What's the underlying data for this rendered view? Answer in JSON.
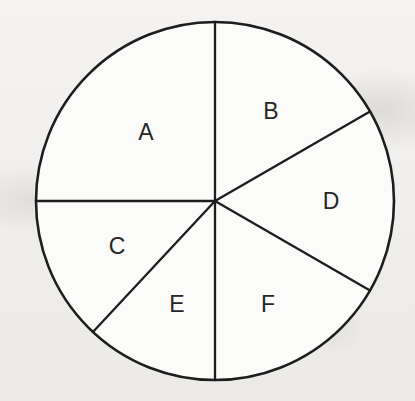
{
  "figure": {
    "background_color": "#f2f1ef",
    "sector_fill_color": "#fbfbfa",
    "line_color": "#1d1d1d"
  },
  "chart_data": {
    "type": "pie",
    "title": "",
    "subtitle": "",
    "xlabel": "",
    "ylabel": "",
    "legend": "none",
    "grid": false,
    "labels_shown_on_slices": true,
    "center": {
      "x": 215,
      "y": 201
    },
    "radius": 179,
    "angle_units": "degrees clockwise from 12 o'clock",
    "categories": [
      "A",
      "B",
      "C",
      "D",
      "E",
      "F"
    ],
    "values": [
      90,
      60,
      47,
      60,
      43,
      60
    ],
    "slices": [
      {
        "label": "A",
        "start_angle": 270,
        "end_angle": 360,
        "sweep": 90,
        "fraction": 0.25,
        "label_x": 146,
        "label_y": 134
      },
      {
        "label": "B",
        "start_angle": 0,
        "end_angle": 60,
        "sweep": 60,
        "fraction": 0.1667,
        "label_x": 271,
        "label_y": 113
      },
      {
        "label": "D",
        "start_angle": 60,
        "end_angle": 120,
        "sweep": 60,
        "fraction": 0.1667,
        "label_x": 331,
        "label_y": 203
      },
      {
        "label": "F",
        "start_angle": 120,
        "end_angle": 180,
        "sweep": 60,
        "fraction": 0.1667,
        "label_x": 268,
        "label_y": 306
      },
      {
        "label": "E",
        "start_angle": 180,
        "end_angle": 223,
        "sweep": 43,
        "fraction": 0.1194,
        "label_x": 177,
        "label_y": 306
      },
      {
        "label": "C",
        "start_angle": 223,
        "end_angle": 270,
        "sweep": 47,
        "fraction": 0.1306,
        "label_x": 117,
        "label_y": 248
      }
    ],
    "divider_rays": [
      {
        "name": "ray-top-vertical",
        "angle": 0
      },
      {
        "name": "ray-b-d",
        "angle": 60
      },
      {
        "name": "ray-d-f",
        "angle": 120
      },
      {
        "name": "ray-bottom-vertical",
        "angle": 180
      },
      {
        "name": "ray-c-e",
        "angle": 223
      },
      {
        "name": "ray-left-horizontal",
        "angle": 270
      }
    ]
  },
  "labels": {
    "a": "A",
    "b": "B",
    "c": "C",
    "d": "D",
    "e": "E",
    "f": "F"
  }
}
